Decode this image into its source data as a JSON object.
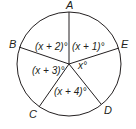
{
  "diagram": {
    "type": "circle-with-central-angles",
    "stroke_color": "#231f20",
    "background": "#ffffff",
    "center": {
      "x": 69,
      "y": 64
    },
    "radius": 52,
    "points": [
      {
        "label": "A",
        "x": 69,
        "y": 12,
        "lx": 66,
        "ly": 9
      },
      {
        "label": "B",
        "x": 19,
        "y": 47,
        "lx": 9,
        "ly": 48
      },
      {
        "label": "C",
        "x": 39,
        "y": 107,
        "lx": 29,
        "ly": 118
      },
      {
        "label": "D",
        "x": 101,
        "y": 104,
        "lx": 104,
        "ly": 114
      },
      {
        "label": "E",
        "x": 119,
        "y": 48,
        "lx": 121,
        "ly": 48
      }
    ],
    "angles": [
      {
        "label": "(x + 2)°",
        "between": "A-B",
        "x": 35,
        "y": 50
      },
      {
        "label": "(x + 1)°",
        "between": "A-E",
        "x": 72,
        "y": 50
      },
      {
        "label": "(x + 3)°",
        "between": "B-C",
        "x": 32,
        "y": 74
      },
      {
        "label": "x°",
        "between": "E-D",
        "x": 78,
        "y": 69
      },
      {
        "label": "(x + 4)°",
        "between": "C-D",
        "x": 54,
        "y": 95
      }
    ]
  }
}
